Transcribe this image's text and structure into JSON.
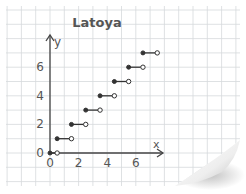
{
  "chart_data": {
    "type": "line",
    "subtype": "step-function",
    "title": "Latoya",
    "xlabel": "x",
    "ylabel": "y",
    "x_ticks": [
      0,
      2,
      4,
      6
    ],
    "y_ticks": [
      0,
      2,
      4,
      6
    ],
    "xlim": [
      0,
      8
    ],
    "ylim": [
      0,
      8
    ],
    "grid": true,
    "legend": null,
    "segments": [
      {
        "y": 0,
        "x_start": 0,
        "x_end": 0.5,
        "start_closed": true,
        "end_closed": false
      },
      {
        "y": 1,
        "x_start": 0.5,
        "x_end": 1.5,
        "start_closed": true,
        "end_closed": false
      },
      {
        "y": 2,
        "x_start": 1.5,
        "x_end": 2.5,
        "start_closed": true,
        "end_closed": false
      },
      {
        "y": 3,
        "x_start": 2.5,
        "x_end": 3.5,
        "start_closed": true,
        "end_closed": false
      },
      {
        "y": 4,
        "x_start": 3.5,
        "x_end": 4.5,
        "start_closed": true,
        "end_closed": false
      },
      {
        "y": 5,
        "x_start": 4.5,
        "x_end": 5.5,
        "start_closed": true,
        "end_closed": false
      },
      {
        "y": 6,
        "x_start": 5.5,
        "x_end": 6.5,
        "start_closed": true,
        "end_closed": false
      },
      {
        "y": 7,
        "x_start": 6.5,
        "x_end": 7.5,
        "start_closed": true,
        "end_closed": false
      }
    ]
  },
  "colors": {
    "paper": "#ffffff",
    "grid": "#d6d9dc",
    "axis": "#444444",
    "segment": "#333333",
    "text": "#555555"
  }
}
